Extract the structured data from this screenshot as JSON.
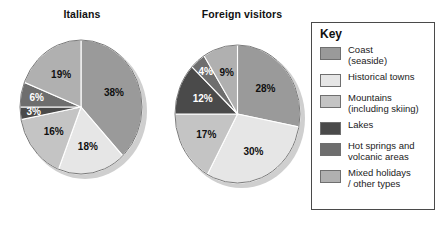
{
  "key": {
    "title": "Key",
    "entries": [
      {
        "label": "Coast\n(seaside)",
        "color": "#9a9a9a"
      },
      {
        "label": "Historical towns",
        "color": "#e6e6e6"
      },
      {
        "label": "Mountains\n(including skiing)",
        "color": "#c4c4c4"
      },
      {
        "label": "Lakes",
        "color": "#4a4a4a"
      },
      {
        "label": "Hot springs and\nvolcanic areas",
        "color": "#6e6e6e"
      },
      {
        "label": "Mixed holidays\n/ other types",
        "color": "#b0b0b0"
      }
    ]
  },
  "chart_data": [
    {
      "type": "pie",
      "title": "Italians",
      "categories": [
        "Coast (seaside)",
        "Historical towns",
        "Mountains (including skiing)",
        "Lakes",
        "Hot springs and volcanic areas",
        "Mixed holidays / other types"
      ],
      "values": [
        38,
        18,
        16,
        3,
        6,
        19
      ],
      "labels": [
        "38%",
        "18%",
        "16%",
        "3%",
        "6%",
        "19%"
      ],
      "colors": [
        "#9a9a9a",
        "#e6e6e6",
        "#c4c4c4",
        "#4a4a4a",
        "#6e6e6e",
        "#b0b0b0"
      ],
      "units": "percent",
      "total": 100,
      "start_angle": 0,
      "direction": "clockwise",
      "legend": "right"
    },
    {
      "type": "pie",
      "title": "Foreign visitors",
      "categories": [
        "Coast (seaside)",
        "Historical towns",
        "Mountains (including skiing)",
        "Lakes",
        "Hot springs and volcanic areas",
        "Mixed holidays / other types"
      ],
      "values": [
        28,
        30,
        17,
        12,
        4,
        9
      ],
      "labels": [
        "28%",
        "30%",
        "17%",
        "12%",
        "4%",
        "9%"
      ],
      "colors": [
        "#9a9a9a",
        "#e6e6e6",
        "#c4c4c4",
        "#4a4a4a",
        "#6e6e6e",
        "#b0b0b0"
      ],
      "units": "percent",
      "total": 100,
      "start_angle": 0,
      "direction": "clockwise",
      "legend": "right"
    }
  ]
}
